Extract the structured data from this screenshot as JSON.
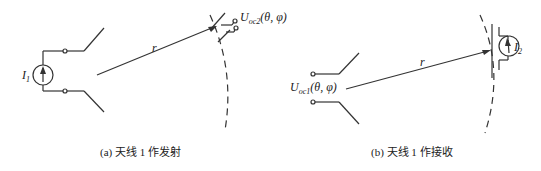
{
  "panel_a": {
    "caption": "(a) 天线 1 作发射",
    "source_label": "I",
    "source_sub": "1",
    "distance_label": "r",
    "voltage_label": "U",
    "voltage_sub": "oc2",
    "voltage_args": "(θ, φ)"
  },
  "panel_b": {
    "caption": "(b) 天线 1 作接收",
    "source_label": "I",
    "source_sub": "2",
    "distance_label": "r",
    "voltage_label": "U",
    "voltage_sub": "oc1",
    "voltage_args": "(θ, φ)"
  }
}
